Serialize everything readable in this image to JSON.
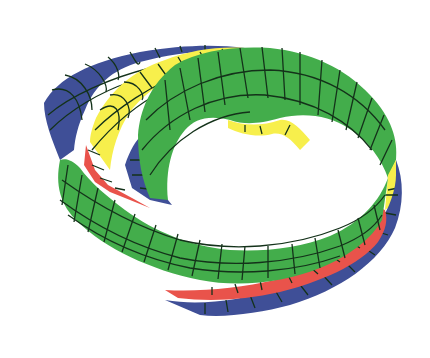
{
  "figure": {
    "background": "#ffffff",
    "colors": {
      "green": "#43ad4b",
      "blue": "#3f4f97",
      "yellow": "#f7ef4c",
      "red": "#e9534b",
      "mesh_lines": "#14321a"
    }
  }
}
